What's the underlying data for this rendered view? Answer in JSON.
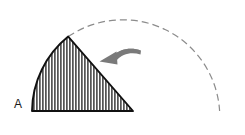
{
  "figure": {
    "background_color": "#ffffff",
    "width": 245,
    "height": 135
  },
  "labels": {
    "sector_label": "A"
  },
  "colors": {
    "outline": "#111111",
    "hatch": "#1a1a1a",
    "dashed_arc": "#8c8c8c",
    "arrow": "#7a7a7a",
    "fill": "#ffffff"
  },
  "geometry": {
    "center_x": 133,
    "center_y": 111,
    "radius": 97,
    "apex_x": 68,
    "apex_y": 37,
    "baseline_left_x": 32,
    "baseline_y": 111,
    "arc_end_x": 219,
    "arc_end_y": 111,
    "hatch_spacing": 3
  },
  "elements": {
    "sector_name": "hatched-sector",
    "dashed_arc_name": "dashed-arc",
    "arrow_name": "rotation-arrow",
    "baseline_name": "baseline"
  }
}
